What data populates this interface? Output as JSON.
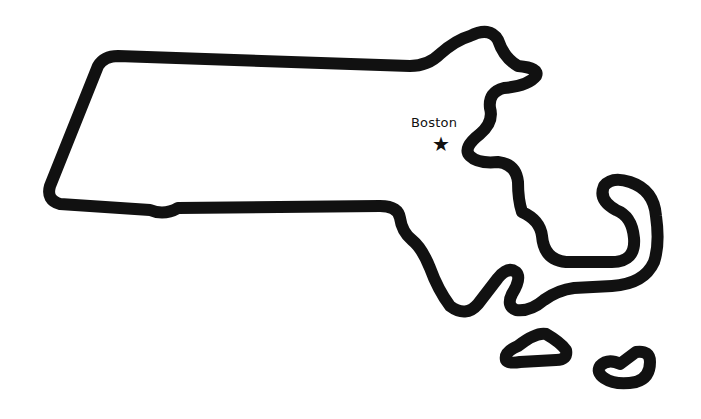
{
  "map": {
    "region": "Massachusetts",
    "outline_color": "#111111",
    "background_color": "#ffffff",
    "cities": [
      {
        "name": "Boston",
        "marker": "★",
        "marker_type": "star-icon",
        "capital": true,
        "x": 441,
        "y": 144
      }
    ],
    "islands": [
      "Martha's Vineyard",
      "Nantucket"
    ]
  }
}
